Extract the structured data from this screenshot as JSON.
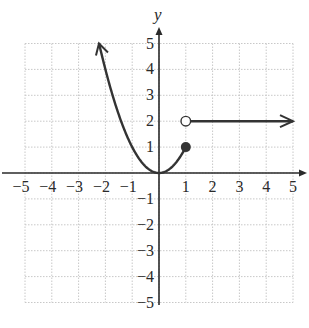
{
  "chart_data": {
    "type": "line",
    "title": "",
    "xlabel": "",
    "ylabel": "y",
    "xlim": [
      -5,
      5
    ],
    "ylim": [
      -5,
      5
    ],
    "grid": true,
    "x_ticks": [
      -5,
      -4,
      -3,
      -2,
      -1,
      1,
      2,
      3,
      4,
      5
    ],
    "y_ticks": [
      5,
      4,
      3,
      2,
      1,
      -1,
      -2,
      -3,
      -4,
      -5
    ],
    "x_tick_labels": [
      "−5",
      "−4",
      "−3",
      "−2",
      "−1",
      "1",
      "2",
      "3",
      "4",
      "5"
    ],
    "y_tick_labels": [
      "5",
      "4",
      "3",
      "2",
      "1",
      "−1",
      "−2",
      "−3",
      "−4",
      "−5"
    ],
    "series": [
      {
        "name": "piece-1 parabola",
        "equation": "y = x^2",
        "domain": "x <= 1",
        "x": [
          -2.24,
          -2,
          -1.5,
          -1,
          -0.5,
          0,
          0.5,
          1
        ],
        "y": [
          5,
          4,
          2.25,
          1,
          0.25,
          0,
          0.25,
          1
        ],
        "left_end": "arrow (continues)",
        "right_end": "closed dot at (1, 1)"
      },
      {
        "name": "piece-2 constant",
        "equation": "y = 2",
        "domain": "x > 1",
        "x": [
          1,
          5
        ],
        "y": [
          2,
          2
        ],
        "left_end": "open circle at (1, 2)",
        "right_end": "arrow (continues)"
      }
    ],
    "points": [
      {
        "x": 1,
        "y": 1,
        "style": "closed"
      },
      {
        "x": 1,
        "y": 2,
        "style": "open"
      }
    ],
    "colors": {
      "curve": "#333333",
      "axis": "#2a2a2a",
      "grid": "#c8c8c8"
    }
  }
}
